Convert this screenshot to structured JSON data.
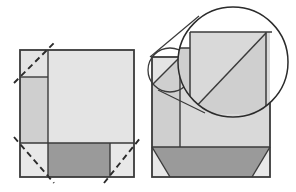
{
  "figure": {
    "type": "geometric-folding-diagram",
    "canvas": {
      "width": 296,
      "height": 192,
      "background": "#ffffff"
    },
    "colors": {
      "stroke": "#3a3a3a",
      "stroke_light": "#4d4d4d",
      "fill_light": "#e4e4e4",
      "fill_medium": "#cfcfcf",
      "fill_dark": "#9a9a9a",
      "fill_white": "#ffffff",
      "dashed_stroke": "#2b2b2b"
    },
    "stroke_widths": {
      "outline": 1.6,
      "inner": 1.4,
      "dashed": 1.8,
      "circle": 1.3
    }
  },
  "left_panel": {
    "label": "unfolded-sheet",
    "sheet": {
      "x": 20,
      "y": 50,
      "width": 114,
      "height": 127,
      "fill": "#e4e4e4"
    },
    "regions": [
      {
        "name": "top-left-corner-flap",
        "x": 20,
        "y": 50,
        "width": 28,
        "height": 27,
        "fill": "#e4e4e4"
      },
      {
        "name": "left-side-strip",
        "x": 20,
        "y": 77,
        "width": 28,
        "height": 66,
        "fill": "#cfcfcf"
      },
      {
        "name": "bottom-left-corner-flap",
        "x": 20,
        "y": 143,
        "width": 28,
        "height": 34,
        "fill": "#e4e4e4"
      },
      {
        "name": "bottom-center-band",
        "x": 48,
        "y": 143,
        "width": 62,
        "height": 34,
        "fill": "#9a9a9a"
      },
      {
        "name": "bottom-right-corner-flap",
        "x": 110,
        "y": 143,
        "width": 24,
        "height": 34,
        "fill": "#e4e4e4"
      },
      {
        "name": "main-field",
        "x": 48,
        "y": 50,
        "width": 86,
        "height": 93,
        "fill": "#e4e4e4"
      }
    ],
    "crease_lines": [
      {
        "name": "vertical-crease",
        "x1": 48,
        "y1": 50,
        "x2": 48,
        "y2": 177
      },
      {
        "name": "horizontal-crease",
        "x1": 20,
        "y1": 143,
        "x2": 134,
        "y2": 143
      },
      {
        "name": "top-left-box-bottom",
        "x1": 20,
        "y1": 77,
        "x2": 48,
        "y2": 77
      },
      {
        "name": "bottom-band-right",
        "x1": 110,
        "y1": 143,
        "x2": 110,
        "y2": 177
      }
    ],
    "fold_guides": [
      {
        "name": "fold-guide-top-left",
        "x1": 14,
        "y1": 83,
        "x2": 54,
        "y2": 43
      },
      {
        "name": "fold-guide-bottom-left",
        "x1": 14,
        "y1": 137,
        "x2": 54,
        "y2": 183
      },
      {
        "name": "fold-guide-bottom-right",
        "x1": 104,
        "y1": 183,
        "x2": 140,
        "y2": 137
      }
    ]
  },
  "right_panel": {
    "label": "folded-sheet",
    "sheet": {
      "x": 152,
      "y": 57,
      "width": 118,
      "height": 120,
      "fill": "#cfcfcf"
    },
    "regions": [
      {
        "name": "folded-left-strip",
        "x": 152,
        "y": 57,
        "width": 28,
        "height": 90,
        "fill": "#cfcfcf"
      },
      {
        "name": "folded-main-field",
        "x": 180,
        "y": 57,
        "width": 90,
        "height": 90,
        "fill": "#d8d8d8"
      },
      {
        "name": "bottom-band-trapezoid",
        "fill": "#9a9a9a",
        "points": "152,147 270,147 252,177 170,177"
      },
      {
        "name": "bottom-left-triangle",
        "fill": "#e4e4e4",
        "points": "152,147 170,177 152,177"
      },
      {
        "name": "bottom-right-triangle",
        "fill": "#e4e4e4",
        "points": "270,147 270,177 252,177"
      }
    ],
    "fold_lines": [
      {
        "name": "corner-fold-diagonal",
        "x1": 152,
        "y1": 85,
        "x2": 180,
        "y2": 57
      },
      {
        "name": "strip-divider",
        "x1": 180,
        "y1": 57,
        "x2": 180,
        "y2": 147
      },
      {
        "name": "band-top-edge",
        "x1": 152,
        "y1": 147,
        "x2": 270,
        "y2": 147
      }
    ]
  },
  "magnifier": {
    "label": "detail-magnifier",
    "source_circle": {
      "cx": 170,
      "cy": 70,
      "r": 22
    },
    "lens_circle": {
      "cx": 233,
      "cy": 62,
      "r": 55
    },
    "connector_tangents": [
      {
        "name": "tangent-upper",
        "x1": 151,
        "y1": 58,
        "x2": 196,
        "y2": 20
      },
      {
        "name": "tangent-lower",
        "x1": 157,
        "y1": 89,
        "x2": 200,
        "y2": 112
      }
    ],
    "magnified_content": {
      "field": {
        "x": 190,
        "y": 32,
        "width": 80,
        "height": 82,
        "fill": "#d8d8d8"
      },
      "left_band": {
        "x": 152,
        "y": 48,
        "width": 38,
        "height": 50,
        "fill": "#cfcfcf"
      },
      "diagonal": {
        "x1": 192,
        "y1": 110,
        "x2": 266,
        "y2": 34
      },
      "vertical_edge": {
        "x1": 190,
        "y1": 32,
        "x2": 190,
        "y2": 114
      },
      "right_edge": {
        "x1": 266,
        "y1": 32,
        "x2": 266,
        "y2": 114
      },
      "top_edge": {
        "x1": 190,
        "y1": 32,
        "x2": 270,
        "y2": 32
      }
    }
  }
}
